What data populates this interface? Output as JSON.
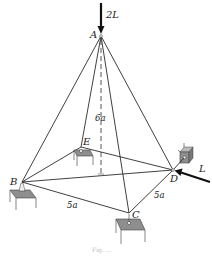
{
  "figure": {
    "joints": {
      "A": "A",
      "B": "B",
      "C": "C",
      "D": "D",
      "E": "E"
    },
    "loads": {
      "vertical_at_A": "2L",
      "horizontal_at_D": "L"
    },
    "dimensions": {
      "height": "6a",
      "side_BC": "5a",
      "side_CD": "5a"
    },
    "members": [
      "AB",
      "AC",
      "AD",
      "AE",
      "BC",
      "CD",
      "DE",
      "EB",
      "BD"
    ],
    "supports": [
      "B",
      "C",
      "D",
      "E"
    ],
    "caption": "Fig. ..."
  },
  "colors": {
    "line": "#2a2a2a",
    "support_fill": "#8e8e8e",
    "background": "#ffffff"
  }
}
